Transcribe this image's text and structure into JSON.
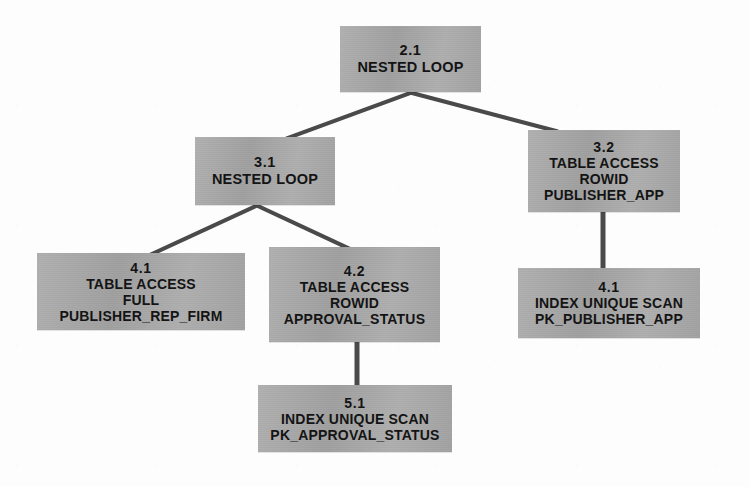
{
  "diagram": {
    "type": "tree",
    "colors": {
      "node_fill": "#a9a9a9",
      "node_text": "#141414",
      "edge": "#4a4a4a",
      "background": "#fdfdfd"
    },
    "nodes": [
      {
        "key": "root",
        "id": "2.1",
        "operation": "NESTED LOOP",
        "lines": [
          "2.1",
          "NESTED LOOP"
        ],
        "x": 340,
        "y": 26,
        "w": 141,
        "h": 66
      },
      {
        "key": "n31",
        "id": "3.1",
        "operation": "NESTED LOOP",
        "lines": [
          "3.1",
          "NESTED LOOP"
        ],
        "x": 195,
        "y": 137,
        "w": 140,
        "h": 68
      },
      {
        "key": "n32",
        "id": "3.2",
        "operation": "TABLE ACCESS ROWID",
        "object": "PUBLISHER_APP",
        "lines": [
          "3.2",
          "TABLE ACCESS",
          "ROWID",
          "PUBLISHER_APP"
        ],
        "x": 528,
        "y": 130,
        "w": 152,
        "h": 82
      },
      {
        "key": "n41a",
        "id": "4.1",
        "operation": "TABLE ACCESS FULL",
        "object": "PUBLISHER_REP_FIRM",
        "lines": [
          "4.1",
          "TABLE ACCESS",
          "FULL",
          "PUBLISHER_REP_FIRM"
        ],
        "x": 37,
        "y": 253,
        "w": 208,
        "h": 77
      },
      {
        "key": "n42",
        "id": "4.2",
        "operation": "TABLE ACCESS ROWID",
        "object": "APPROVAL_STATUS",
        "lines": [
          "4.2",
          "TABLE ACCESS",
          "ROWID",
          "APPROVAL_STATUS"
        ],
        "x": 269,
        "y": 247,
        "w": 171,
        "h": 95
      },
      {
        "key": "n41b",
        "id": "4.1",
        "operation": "INDEX UNIQUE SCAN",
        "object": "PK_PUBLISHER_APP",
        "lines": [
          "4.1",
          "INDEX UNIQUE SCAN",
          "PK_PUBLISHER_APP"
        ],
        "x": 518,
        "y": 268,
        "w": 182,
        "h": 70
      },
      {
        "key": "n51",
        "id": "5.1",
        "operation": "INDEX UNIQUE SCAN",
        "object": "PK_APPROVAL_STATUS",
        "lines": [
          "5.1",
          "INDEX UNIQUE SCAN",
          "PK_APPROVAL_STATUS"
        ],
        "x": 258,
        "y": 385,
        "w": 194,
        "h": 67
      }
    ],
    "edges": [
      {
        "key": "e-root-31",
        "from": "2.1",
        "to": "3.1",
        "style": "diagonal"
      },
      {
        "key": "e-root-32",
        "from": "2.1",
        "to": "3.2",
        "style": "diagonal"
      },
      {
        "key": "e-31-41a",
        "from": "3.1",
        "to": "4.1",
        "style": "diagonal"
      },
      {
        "key": "e-31-42",
        "from": "3.1",
        "to": "4.2",
        "style": "diagonal"
      },
      {
        "key": "e-32-41b",
        "from": "3.2",
        "to": "4.1",
        "style": "vertical"
      },
      {
        "key": "e-42-51",
        "from": "4.2",
        "to": "5.1",
        "style": "vertical"
      }
    ]
  }
}
